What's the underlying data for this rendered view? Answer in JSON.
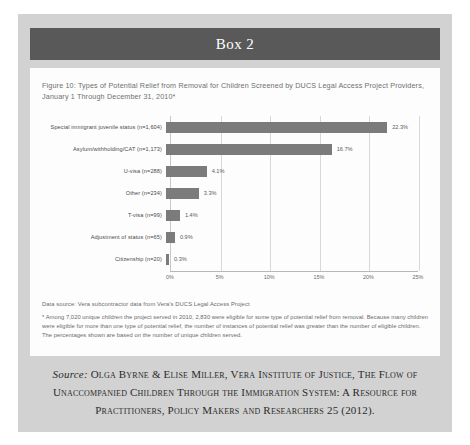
{
  "box": {
    "title": "Box 2"
  },
  "figure": {
    "caption": "Figure 10: Types of Potential Relief from Removal for Children Screened by DUCS Legal Access Project Providers, January 1 Through December 31, 2010*",
    "data_source": "Data source: Vera subcontractor data from Vera's DUCS Legal Access Project",
    "footnote": "* Among 7,020 unique children the project served in 2010, 2,830 were eligible for some type of potential relief from removal. Because many children were eligible for more than one type of potential relief, the number of instances of potential relief was greater than the number of eligible children. The percentages shown are based on the number of unique children served."
  },
  "citation": {
    "source_word": "Source:",
    "text": " Olga Byrne & Elise Miller, Vera Institute of Justice, The Flow of Unaccompanied Children Through the Immigration System: A Resource for Practitioners, Policy Makers and Researchers 25 (2012)."
  },
  "chart_data": {
    "type": "bar",
    "orientation": "horizontal",
    "title": "Figure 10: Types of Potential Relief from Removal for Children Screened by DUCS Legal Access Project Providers, January 1 Through December 31, 2010*",
    "xlabel": "",
    "ylabel": "",
    "xlim": [
      0,
      25
    ],
    "xticks": [
      "0%",
      "5%",
      "10%",
      "15%",
      "20%",
      "25%"
    ],
    "xtick_values": [
      0,
      5,
      10,
      15,
      20,
      25
    ],
    "grid": true,
    "legend": "none",
    "bar_color": "#7b7b7b",
    "categories": [
      "Special immigrant juvenile status (n=1,604)",
      "Asylum/withholding/CAT (n=1,173)",
      "U-visa (n=288)",
      "Other (n=234)",
      "T-visa (n=99)",
      "Adjustment of status (n=65)",
      "Citizenship (n=20)"
    ],
    "values": [
      22.3,
      16.7,
      4.1,
      3.3,
      1.4,
      0.9,
      0.3
    ],
    "value_labels": [
      "22.3%",
      "16.7%",
      "4.1%",
      "3.3%",
      "1.4%",
      "0.9%",
      "0.3%"
    ]
  }
}
